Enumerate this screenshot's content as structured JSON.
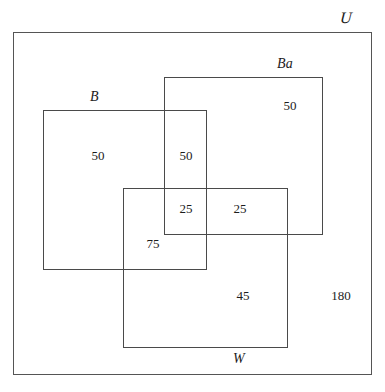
{
  "diagram": {
    "type": "venn-rectangles",
    "sets": [
      {
        "id": "B",
        "label": "B",
        "name": "set-b"
      },
      {
        "id": "Ba",
        "label": "Ba",
        "name": "set-ba"
      },
      {
        "id": "W",
        "label": "W",
        "name": "set-w"
      }
    ],
    "universe": {
      "label": "U",
      "name": "universal-set"
    },
    "regions": [
      {
        "id": "b_only",
        "label": "B only",
        "value": "50"
      },
      {
        "id": "b_ba",
        "label": "B and Ba only",
        "value": "50"
      },
      {
        "id": "ba_only",
        "label": "Ba only",
        "value": "50"
      },
      {
        "id": "b_ba_w",
        "label": "B and Ba and W",
        "value": "25"
      },
      {
        "id": "ba_w",
        "label": "Ba and W only",
        "value": "25"
      },
      {
        "id": "b_w",
        "label": "B and W only",
        "value": "75"
      },
      {
        "id": "w_only",
        "label": "W only",
        "value": "45"
      },
      {
        "id": "outside",
        "label": "Outside all three sets",
        "value": "180"
      }
    ],
    "colors": {
      "stroke": "#4a4a4a",
      "text": "#1c1c1c",
      "background": "#ffffff"
    }
  },
  "chart_data": {
    "type": "diagram",
    "categories": [
      "B only",
      "B and Ba only",
      "Ba only",
      "B and Ba and W",
      "Ba and W only",
      "B and W only",
      "W only",
      "Outside all three sets"
    ],
    "values": [
      50,
      50,
      50,
      25,
      25,
      75,
      45,
      180
    ],
    "set_labels": [
      "B",
      "Ba",
      "W"
    ],
    "universe_label": "U",
    "xlabel": "",
    "ylabel": ""
  }
}
